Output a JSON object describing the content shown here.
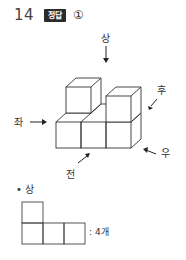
{
  "question": {
    "number": "14",
    "badge": "정답",
    "answer": "①"
  },
  "figure": {
    "directions": {
      "top": "상",
      "back": "후",
      "left": "좌",
      "right": "우",
      "front": "전"
    }
  },
  "top_view": {
    "heading": "• 상",
    "count_text": ": 4개",
    "grid": [
      [
        1,
        0,
        0
      ],
      [
        1,
        1,
        1
      ]
    ]
  }
}
